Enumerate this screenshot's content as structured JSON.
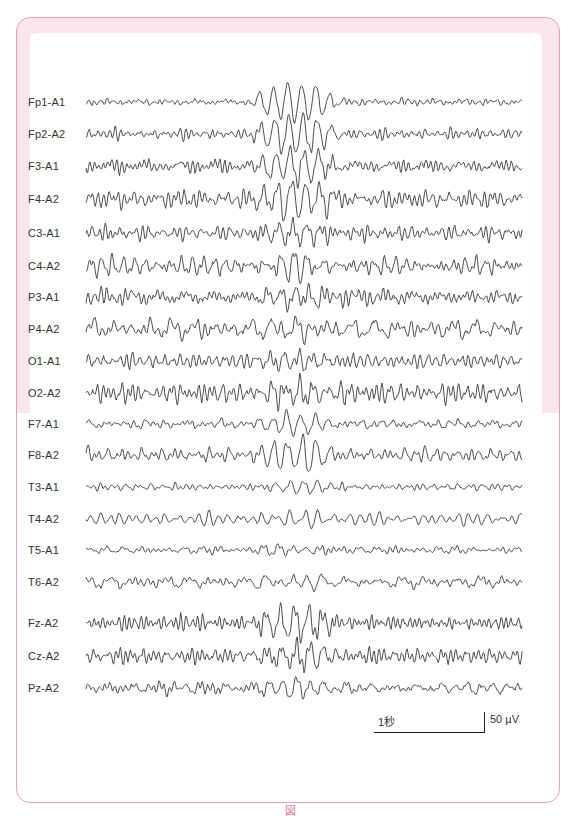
{
  "figure": {
    "caption": "図",
    "frame_color": "#e6a2b4",
    "band_color": "#fbe6ee",
    "trace_color": "#3a3a3a"
  },
  "chart_data": {
    "type": "line",
    "title": "",
    "xlabel": "",
    "ylabel": "",
    "channels": [
      "Fp1-A1",
      "Fp2-A2",
      "F3-A1",
      "F4-A2",
      "C3-A1",
      "C4-A2",
      "P3-A1",
      "P4-A2",
      "O1-A1",
      "O2-A2",
      "F7-A1",
      "F8-A2",
      "T3-A1",
      "T4-A2",
      "T5-A1",
      "T6-A2",
      "Fz-A2",
      "Cz-A2",
      "Pz-A2"
    ],
    "montage": "referential (ear reference A1/A2)",
    "duration_s": 10,
    "scale": {
      "time_label": "1秒",
      "time_value_s": 1,
      "amplitude_label": "50 µV",
      "amplitude_value_uv": 50
    },
    "events": [
      {
        "description": "high-amplitude paroxysmal burst, frontal predominance",
        "start_s": 4.0,
        "end_s": 5.6
      }
    ],
    "channel_burst_gain": [
      3.2,
      3.4,
      2.8,
      3.0,
      2.0,
      1.6,
      1.4,
      1.0,
      1.3,
      1.3,
      1.8,
      2.6,
      0.8,
      0.9,
      0.7,
      0.9,
      2.6,
      1.8,
      1.2
    ],
    "channel_background_amp_uv": [
      8,
      10,
      14,
      16,
      14,
      16,
      16,
      20,
      18,
      20,
      9,
      12,
      6,
      9,
      7,
      12,
      16,
      16,
      16
    ]
  }
}
